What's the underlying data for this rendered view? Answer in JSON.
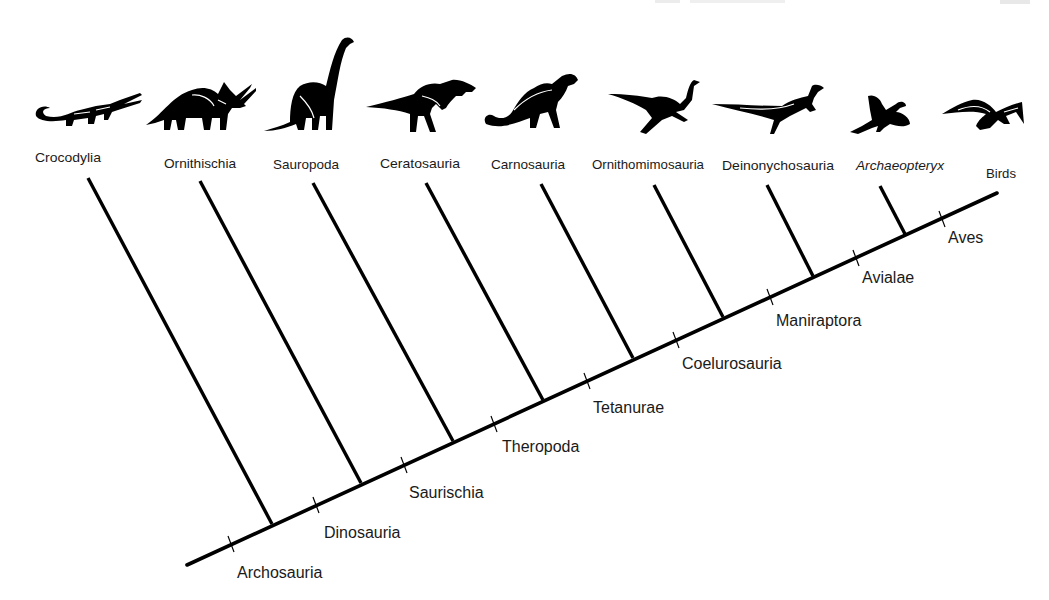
{
  "figure": {
    "type": "cladogram",
    "header_faint_text_visible": true,
    "colors": {
      "line": "#000000",
      "text": "#1a1a1a",
      "background": "#ffffff"
    }
  },
  "taxa": [
    {
      "name": "Crocodylia",
      "italic": false,
      "icon": "crocodile-silhouette-icon"
    },
    {
      "name": "Ornithischia",
      "italic": false,
      "icon": "triceratops-silhouette-icon"
    },
    {
      "name": "Sauropoda",
      "italic": false,
      "icon": "sauropod-silhouette-icon"
    },
    {
      "name": "Ceratosauria",
      "italic": false,
      "icon": "ceratosaur-silhouette-icon"
    },
    {
      "name": "Carnosauria",
      "italic": false,
      "icon": "carnosaur-silhouette-icon"
    },
    {
      "name": "Ornithomimosauria",
      "italic": false,
      "icon": "ornithomimid-silhouette-icon"
    },
    {
      "name": "Deinonychosauria",
      "italic": false,
      "icon": "dromaeosaur-silhouette-icon"
    },
    {
      "name": "Archaeopteryx",
      "italic": true,
      "icon": "archaeopteryx-silhouette-icon"
    },
    {
      "name": "Birds",
      "italic": false,
      "icon": "bird-silhouette-icon"
    }
  ],
  "clades": [
    {
      "name": "Archosauria"
    },
    {
      "name": "Dinosauria"
    },
    {
      "name": "Saurischia"
    },
    {
      "name": "Theropoda"
    },
    {
      "name": "Tetanurae"
    },
    {
      "name": "Coelurosauria"
    },
    {
      "name": "Maniraptora"
    },
    {
      "name": "Avialae"
    },
    {
      "name": "Aves"
    }
  ]
}
